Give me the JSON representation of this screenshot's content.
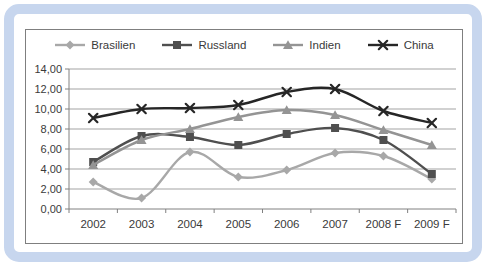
{
  "frame": {
    "background": "#ffffff",
    "border_color": "#c7d6ee",
    "chart_background": "#ffffff",
    "chart_border_color": "#7f7f7f",
    "gridline_color": "#a3a3a3",
    "axis_color": "#808080",
    "text_color": "#3a3a3a"
  },
  "chart_data": {
    "type": "line",
    "title": "",
    "xlabel": "",
    "ylabel": "",
    "categories": [
      "2002",
      "2003",
      "2004",
      "2005",
      "2006",
      "2007",
      "2008 F",
      "2009 F"
    ],
    "series": [
      {
        "name": "Brasilien",
        "marker": "diamond",
        "color": "#a8a8a8",
        "values": [
          2.7,
          1.1,
          5.7,
          3.2,
          3.9,
          5.6,
          5.3,
          3.0
        ]
      },
      {
        "name": "Russland",
        "marker": "square",
        "color": "#4f4f4f",
        "values": [
          4.7,
          7.3,
          7.2,
          6.4,
          7.5,
          8.1,
          6.9,
          3.5
        ]
      },
      {
        "name": "Indien",
        "marker": "triangle",
        "color": "#949494",
        "values": [
          4.4,
          6.9,
          8.0,
          9.2,
          9.9,
          9.4,
          7.9,
          6.4
        ]
      },
      {
        "name": "China",
        "marker": "x",
        "color": "#262626",
        "values": [
          9.1,
          10.0,
          10.1,
          10.4,
          11.7,
          12.0,
          9.8,
          8.6
        ]
      }
    ],
    "ylim": [
      0,
      14
    ],
    "ytick_step": 2,
    "ytick_labels": [
      "0,00",
      "2,00",
      "4,00",
      "6,00",
      "8,00",
      "10,00",
      "12,00",
      "14,00"
    ],
    "grid": true,
    "legend_position": "top",
    "smoothed_lines": true
  }
}
